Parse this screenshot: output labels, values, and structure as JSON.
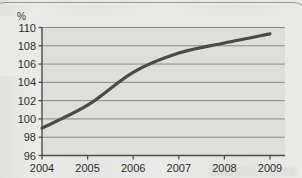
{
  "chart_data": {
    "type": "line",
    "title": "",
    "subtitle": "",
    "xlabel": "",
    "ylabel": "%",
    "unit_label": "%",
    "categories": [
      "2004",
      "2005",
      "2006",
      "2007",
      "2008",
      "2009"
    ],
    "x": [
      2004,
      2005,
      2006,
      2007,
      2008,
      2009
    ],
    "series": [
      {
        "name": "index",
        "values": [
          99.0,
          101.5,
          105.1,
          107.2,
          108.3,
          109.3
        ]
      }
    ],
    "ylim": [
      96,
      110
    ],
    "yticks": [
      96,
      98,
      100,
      102,
      104,
      106,
      108,
      110
    ],
    "ytick_labels": [
      "96",
      "98",
      "100",
      "102",
      "104",
      "106",
      "108",
      "110"
    ],
    "xtick_labels": [
      "2004",
      "2005",
      "2006",
      "2007",
      "2008",
      "2009"
    ],
    "grid": true,
    "grid_axis": "y",
    "legend": false,
    "legend_position": "none",
    "line_color": "#4a4a46",
    "grid_color": "#7f7f7c",
    "axis_color": "#4c4c48",
    "plot_background": "#dedeDB",
    "page_background": "#e9e9e7",
    "text_color": "#2e2e29"
  }
}
